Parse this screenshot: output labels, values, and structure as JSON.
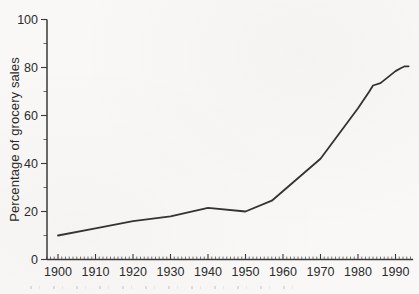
{
  "colors": {
    "paper": "#f9f8f6",
    "axis": "#3a3a3a",
    "tick": "#444444",
    "text": "#2b2b2b",
    "line": "#333333"
  },
  "chart_data": {
    "type": "line",
    "title": "",
    "xlabel": "",
    "ylabel": "Percentage of grocery sales",
    "x_tick_values": [
      1900,
      1910,
      1920,
      1930,
      1940,
      1950,
      1960,
      1970,
      1980,
      1990
    ],
    "x_tick_labels": [
      "1900",
      "1910",
      "1920",
      "1930",
      "1940",
      "1950",
      "1960",
      "1970",
      "1980",
      "1990"
    ],
    "y_tick_values": [
      0,
      20,
      40,
      60,
      80,
      100
    ],
    "y_tick_labels": [
      "0",
      "20",
      "40",
      "60",
      "80",
      "100"
    ],
    "x_minor_step": 1,
    "y_minor_step": 10,
    "xlim": [
      1897,
      1994.7
    ],
    "ylim": [
      0,
      100
    ],
    "grid": false,
    "legend": "none",
    "series": [
      {
        "name": "percentage-of-grocery-sales",
        "points": [
          [
            1900,
            10
          ],
          [
            1910,
            13
          ],
          [
            1920,
            16
          ],
          [
            1930,
            18
          ],
          [
            1940,
            21.5
          ],
          [
            1950,
            20
          ],
          [
            1957,
            24.5
          ],
          [
            1970,
            42
          ],
          [
            1980,
            63
          ],
          [
            1983,
            70
          ],
          [
            1984,
            72.5
          ],
          [
            1986,
            73.5
          ],
          [
            1988,
            76
          ],
          [
            1990,
            78.5
          ],
          [
            1991.5,
            79.8
          ],
          [
            1992.5,
            80.5
          ],
          [
            1993.5,
            80.5
          ]
        ]
      }
    ]
  }
}
